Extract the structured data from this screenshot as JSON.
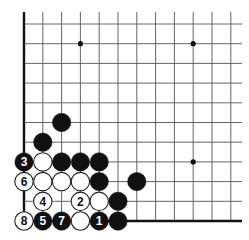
{
  "diagram": {
    "grid": {
      "origin_x": 24,
      "origin_y": 221,
      "col_spacing": 18.8,
      "row_spacing": 19.7,
      "num_cols": 12,
      "num_rows": 11,
      "top_extent_y": 12,
      "right_extent_x": 242,
      "line_color": "#555555",
      "edge_color": "#111111"
    },
    "star_points": [
      {
        "col": 3,
        "row": 9
      },
      {
        "col": 9,
        "row": 9
      },
      {
        "col": 9,
        "row": 3
      }
    ],
    "stones": [
      {
        "color": "black",
        "col": 2,
        "row": 5,
        "label": ""
      },
      {
        "color": "black",
        "col": 1,
        "row": 4,
        "label": ""
      },
      {
        "color": "black",
        "col": 0,
        "row": 3,
        "label": "3"
      },
      {
        "color": "white",
        "col": 1,
        "row": 3,
        "label": ""
      },
      {
        "color": "black",
        "col": 2,
        "row": 3,
        "label": ""
      },
      {
        "color": "black",
        "col": 3,
        "row": 3,
        "label": ""
      },
      {
        "color": "black",
        "col": 4,
        "row": 3,
        "label": ""
      },
      {
        "color": "white",
        "col": 0,
        "row": 2,
        "label": "6"
      },
      {
        "color": "white",
        "col": 1,
        "row": 2,
        "label": ""
      },
      {
        "color": "white",
        "col": 2,
        "row": 2,
        "label": ""
      },
      {
        "color": "white",
        "col": 3,
        "row": 2,
        "label": ""
      },
      {
        "color": "black",
        "col": 4,
        "row": 2,
        "label": ""
      },
      {
        "color": "black",
        "col": 6,
        "row": 2,
        "label": ""
      },
      {
        "color": "white",
        "col": 1,
        "row": 1,
        "label": "4"
      },
      {
        "color": "white",
        "col": 3,
        "row": 1,
        "label": "2"
      },
      {
        "color": "white",
        "col": 4,
        "row": 1,
        "label": ""
      },
      {
        "color": "black",
        "col": 5,
        "row": 1,
        "label": ""
      },
      {
        "color": "white",
        "col": 0,
        "row": 0,
        "label": "8"
      },
      {
        "color": "black",
        "col": 1,
        "row": 0,
        "label": "5"
      },
      {
        "color": "black",
        "col": 2,
        "row": 0,
        "label": "7"
      },
      {
        "color": "white",
        "col": 3,
        "row": 0,
        "label": ""
      },
      {
        "color": "black",
        "col": 4,
        "row": 0,
        "label": "1"
      },
      {
        "color": "black",
        "col": 5,
        "row": 0,
        "label": ""
      }
    ],
    "colors": {
      "black_stone": "#111111",
      "white_stone": "#ffffff",
      "white_stone_outline": "#222222",
      "label_on_black": "#ffffff",
      "label_on_white": "#111111"
    }
  }
}
